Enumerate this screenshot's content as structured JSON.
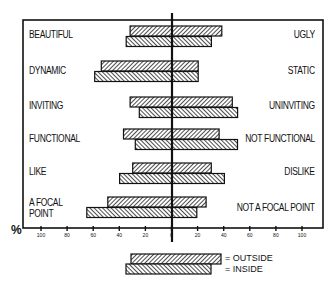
{
  "chart_data": {
    "type": "bar",
    "subtype": "diverging-horizontal-bar",
    "title": "",
    "xlabel": "%",
    "ylabel": "",
    "xlim": [
      -100,
      100
    ],
    "x_ticks": [
      "100",
      "80",
      "60",
      "40",
      "20",
      "0",
      "20",
      "40",
      "60",
      "80",
      "100"
    ],
    "grid": false,
    "legend_position": "bottom-center",
    "categories": [
      {
        "left": "BEAUTIFUL",
        "right": "UGLY"
      },
      {
        "left": "DYNAMIC",
        "right": "STATIC"
      },
      {
        "left": "INVITING",
        "right": "UNINVITING"
      },
      {
        "left": "FUNCTIONAL",
        "right": "NOT FUNCTIONAL"
      },
      {
        "left": "LIKE",
        "right": "DISLIKE"
      },
      {
        "left": "A FOCAL POINT",
        "right": "NOT A FOCAL POINT"
      }
    ],
    "series": [
      {
        "name": "OUTSIDE",
        "pattern": "forward-hatch",
        "left_values": [
          32,
          54,
          32,
          37,
          30,
          49
        ],
        "right_values": [
          38,
          20,
          46,
          36,
          30,
          26
        ]
      },
      {
        "name": "INSIDE",
        "pattern": "back-hatch",
        "left_values": [
          35,
          59,
          25,
          28,
          40,
          65
        ],
        "right_values": [
          30,
          20,
          50,
          50,
          40,
          19
        ]
      }
    ]
  },
  "labels": {
    "left": [
      "BEAUTIFUL",
      "DYNAMIC",
      "INVITING",
      "FUNCTIONAL",
      "LIKE",
      "A FOCAL",
      "POINT"
    ],
    "right": [
      "UGLY",
      "STATIC",
      "UNINVITING",
      "NOT FUNCTIONAL",
      "DISLIKE",
      "NOT A FOCAL POINT"
    ],
    "percent": "%",
    "zero_marker": "|"
  },
  "legend": {
    "outside": "= OUTSIDE",
    "inside": "= INSIDE"
  },
  "colors": {
    "ink": "#111111",
    "background": "#ffffff",
    "hatch_fill": "#9a9a9a"
  }
}
